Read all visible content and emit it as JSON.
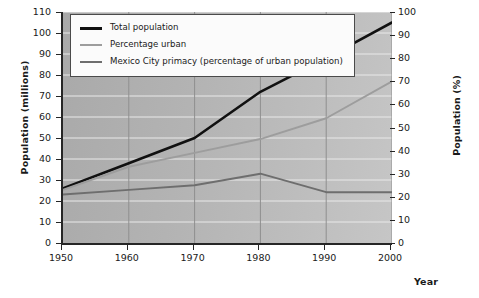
{
  "chart_data": {
    "type": "line",
    "title": "",
    "xlabel": "Year",
    "ylabel_left": "Population (millions)",
    "ylabel_right": "Population (%)",
    "x": [
      1950,
      1960,
      1970,
      1980,
      1990,
      2000
    ],
    "xticklabels": [
      "1950",
      "1960",
      "1970",
      "1980",
      "1990",
      "2000"
    ],
    "xlim": [
      1950,
      2000
    ],
    "ylim_left": [
      0,
      110
    ],
    "yticks_left": [
      0,
      10,
      20,
      30,
      40,
      50,
      60,
      70,
      80,
      90,
      100,
      110
    ],
    "yticklabels_left": [
      "0",
      "10",
      "20",
      "30",
      "40",
      "50",
      "60",
      "70",
      "80",
      "90",
      "100",
      "110"
    ],
    "ylim_right": [
      0,
      100
    ],
    "yticks_right": [
      0,
      10,
      20,
      30,
      40,
      50,
      60,
      70,
      80,
      90,
      100
    ],
    "yticklabels_right": [
      "0",
      "10",
      "20",
      "30",
      "40",
      "50",
      "60",
      "70",
      "80",
      "90",
      "100"
    ],
    "grid": true,
    "legend_position": "upper left",
    "series": [
      {
        "name": "Total population",
        "axis": "left",
        "color": "#111111",
        "width": 2.6,
        "values": [
          26,
          38,
          50,
          72,
          88,
          105
        ]
      },
      {
        "name": "Percentage urban",
        "axis": "right",
        "color": "#9d9d9d",
        "width": 1.9,
        "values": [
          23,
          33,
          39,
          45,
          54,
          70
        ]
      },
      {
        "name": "Mexico City primacy (percentage of urban population)",
        "axis": "right",
        "color": "#6e6e6e",
        "width": 1.9,
        "values": [
          21,
          23,
          25,
          30,
          22,
          22
        ]
      }
    ],
    "legend": [
      {
        "label": "Total population",
        "color": "#111111",
        "width": 2.6
      },
      {
        "label": "Percentage urban",
        "color": "#9d9d9d",
        "width": 1.9
      },
      {
        "label": "Mexico City primacy (percentage of urban population)",
        "color": "#6e6e6e",
        "width": 1.9
      }
    ]
  }
}
